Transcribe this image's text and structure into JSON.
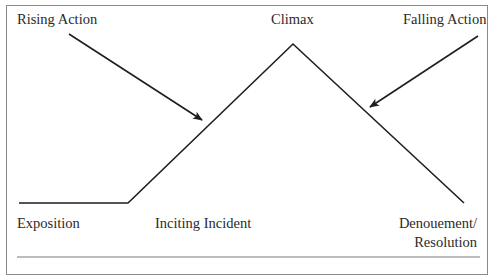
{
  "diagram": {
    "type": "plot-structure",
    "labels": {
      "rising_action": "Rising Action",
      "climax": "Climax",
      "falling_action": "Falling Action",
      "exposition": "Exposition",
      "inciting_incident": "Inciting Incident",
      "denouement_line1": "Denouement/",
      "denouement_line2": "Resolution"
    },
    "colors": {
      "line": "#1e1e1e",
      "text": "#2a2a2a",
      "border": "#8a8a8a",
      "rule": "#7a7a7a",
      "background": "#ffffff"
    },
    "plot_line_points": [
      [
        19,
        203
      ],
      [
        128,
        203
      ],
      [
        293,
        44
      ],
      [
        464,
        203
      ]
    ],
    "arrows": [
      {
        "name": "rising-action-arrow",
        "from": [
          69,
          34
        ],
        "to": [
          202,
          120
        ]
      },
      {
        "name": "falling-action-arrow",
        "from": [
          478,
          36
        ],
        "to": [
          370,
          107
        ]
      }
    ]
  }
}
